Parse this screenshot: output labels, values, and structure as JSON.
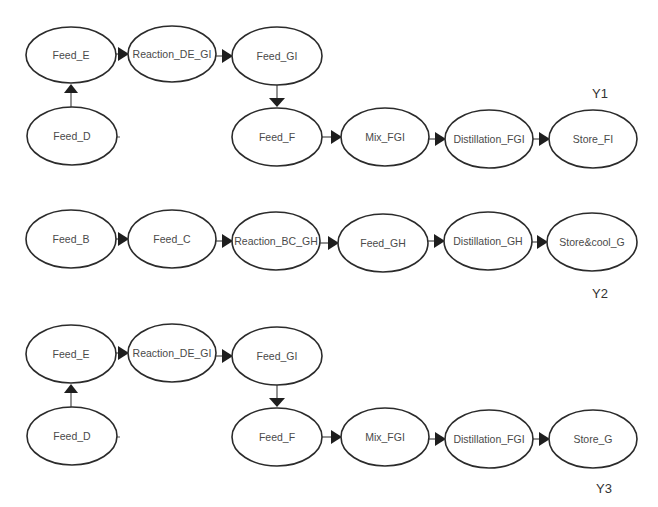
{
  "diagram": {
    "type": "process-flow",
    "width": 658,
    "height": 507,
    "colors": {
      "background": "#ffffff",
      "node_stroke": "#2b2b2b",
      "node_text": "#4a4a4a",
      "arrow": "#1e1e1e",
      "label_text": "#333333"
    },
    "scenarios": [
      {
        "id": "Y1",
        "label": "Y1",
        "label_pos": [
          600,
          93
        ],
        "nodes": [
          {
            "id": "y1-feed-e",
            "label": "Feed_E",
            "cx": 71,
            "cy": 55,
            "rx": 45,
            "ry": 28
          },
          {
            "id": "y1-reaction-de-gi",
            "label": "Reaction_DE_GI",
            "cx": 172,
            "cy": 54,
            "rx": 44,
            "ry": 28
          },
          {
            "id": "y1-feed-gi",
            "label": "Feed_GI",
            "cx": 277,
            "cy": 56,
            "rx": 45,
            "ry": 29
          },
          {
            "id": "y1-feed-d",
            "label": "Feed_D",
            "cx": 72,
            "cy": 136,
            "rx": 45,
            "ry": 29
          },
          {
            "id": "y1-feed-f",
            "label": "Feed_F",
            "cx": 277,
            "cy": 137,
            "rx": 45,
            "ry": 29
          },
          {
            "id": "y1-mix-fgi",
            "label": "Mix_FGI",
            "cx": 385,
            "cy": 137,
            "rx": 44,
            "ry": 29
          },
          {
            "id": "y1-distillation-fgi",
            "label": "Distillation_FGI",
            "cx": 489,
            "cy": 139,
            "rx": 44,
            "ry": 29
          },
          {
            "id": "y1-store-fi",
            "label": "Store_FI",
            "cx": 593,
            "cy": 139,
            "rx": 44,
            "ry": 29
          }
        ],
        "edges": [
          {
            "from": "y1-feed-e",
            "to": "y1-reaction-de-gi",
            "dir": "right"
          },
          {
            "from": "y1-reaction-de-gi",
            "to": "y1-feed-gi",
            "dir": "right"
          },
          {
            "from": "y1-feed-d",
            "to": "y1-feed-e",
            "dir": "up"
          },
          {
            "from": "y1-feed-gi",
            "to": "y1-feed-f",
            "dir": "down"
          },
          {
            "from": "y1-feed-f",
            "to": "y1-mix-fgi",
            "dir": "right"
          },
          {
            "from": "y1-mix-fgi",
            "to": "y1-distillation-fgi",
            "dir": "right"
          },
          {
            "from": "y1-distillation-fgi",
            "to": "y1-store-fi",
            "dir": "right"
          }
        ],
        "stubs": [
          {
            "node": "y1-feed-d",
            "side": "right"
          }
        ]
      },
      {
        "id": "Y2",
        "label": "Y2",
        "label_pos": [
          600,
          293
        ],
        "nodes": [
          {
            "id": "y2-feed-b",
            "label": "Feed_B",
            "cx": 71,
            "cy": 239,
            "rx": 45,
            "ry": 29
          },
          {
            "id": "y2-feed-c",
            "label": "Feed_C",
            "cx": 172,
            "cy": 239,
            "rx": 44,
            "ry": 29
          },
          {
            "id": "y2-reaction-bc-gh",
            "label": "Reaction_BC_GH",
            "cx": 276,
            "cy": 241,
            "rx": 44,
            "ry": 29
          },
          {
            "id": "y2-feed-gh",
            "label": "Feed_GH",
            "cx": 383,
            "cy": 243,
            "rx": 45,
            "ry": 29
          },
          {
            "id": "y2-distillation-gh",
            "label": "Distillation_GH",
            "cx": 488,
            "cy": 241,
            "rx": 44,
            "ry": 29
          },
          {
            "id": "y2-store-cool-g",
            "label": "Store&cool_G",
            "cx": 592,
            "cy": 242,
            "rx": 45,
            "ry": 29
          }
        ],
        "edges": [
          {
            "from": "y2-feed-b",
            "to": "y2-feed-c",
            "dir": "right"
          },
          {
            "from": "y2-feed-c",
            "to": "y2-reaction-bc-gh",
            "dir": "right"
          },
          {
            "from": "y2-reaction-bc-gh",
            "to": "y2-feed-gh",
            "dir": "right"
          },
          {
            "from": "y2-feed-gh",
            "to": "y2-distillation-gh",
            "dir": "right"
          },
          {
            "from": "y2-distillation-gh",
            "to": "y2-store-cool-g",
            "dir": "right"
          }
        ],
        "stubs": []
      },
      {
        "id": "Y3",
        "label": "Y3",
        "label_pos": [
          604,
          488
        ],
        "nodes": [
          {
            "id": "y3-feed-e",
            "label": "Feed_E",
            "cx": 71,
            "cy": 354,
            "rx": 45,
            "ry": 29
          },
          {
            "id": "y3-reaction-de-gi",
            "label": "Reaction_DE_GI",
            "cx": 172,
            "cy": 353,
            "rx": 44,
            "ry": 29
          },
          {
            "id": "y3-feed-gi",
            "label": "Feed_GI",
            "cx": 277,
            "cy": 356,
            "rx": 45,
            "ry": 29
          },
          {
            "id": "y3-feed-d",
            "label": "Feed_D",
            "cx": 72,
            "cy": 436,
            "rx": 45,
            "ry": 29
          },
          {
            "id": "y3-feed-f",
            "label": "Feed_F",
            "cx": 277,
            "cy": 437,
            "rx": 45,
            "ry": 29
          },
          {
            "id": "y3-mix-fgi",
            "label": "Mix_FGI",
            "cx": 385,
            "cy": 437,
            "rx": 44,
            "ry": 29
          },
          {
            "id": "y3-distillation-fgi",
            "label": "Distillation_FGI",
            "cx": 489,
            "cy": 439,
            "rx": 44,
            "ry": 29
          },
          {
            "id": "y3-store-g",
            "label": "Store_G",
            "cx": 593,
            "cy": 439,
            "rx": 44,
            "ry": 29
          }
        ],
        "edges": [
          {
            "from": "y3-feed-e",
            "to": "y3-reaction-de-gi",
            "dir": "right"
          },
          {
            "from": "y3-reaction-de-gi",
            "to": "y3-feed-gi",
            "dir": "right"
          },
          {
            "from": "y3-feed-d",
            "to": "y3-feed-e",
            "dir": "up"
          },
          {
            "from": "y3-feed-gi",
            "to": "y3-feed-f",
            "dir": "down"
          },
          {
            "from": "y3-feed-f",
            "to": "y3-mix-fgi",
            "dir": "right"
          },
          {
            "from": "y3-mix-fgi",
            "to": "y3-distillation-fgi",
            "dir": "right"
          },
          {
            "from": "y3-distillation-fgi",
            "to": "y3-store-g",
            "dir": "right"
          }
        ],
        "stubs": [
          {
            "node": "y3-feed-d",
            "side": "right"
          }
        ]
      }
    ]
  }
}
